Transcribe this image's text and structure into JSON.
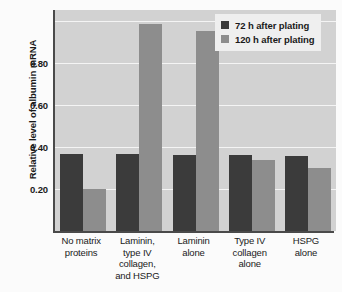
{
  "chart_data": {
    "type": "bar",
    "title": "",
    "xlabel": "",
    "ylabel": "Relative level of albumin mRNA",
    "ylim": [
      0,
      1.05
    ],
    "yticks": [
      0.2,
      0.4,
      0.6,
      0.8
    ],
    "ytick_labels": [
      "0.20",
      "0.40",
      "0.60",
      "0.80"
    ],
    "gridlines": [
      0.2,
      0.4,
      0.6,
      0.8,
      1.0
    ],
    "grid": true,
    "legend_position": "top-right",
    "categories": [
      "No matrix proteins",
      "Laminin, type IV collagen, and HSPG",
      "Laminin alone",
      "Type IV collagen alone",
      "HSPG alone"
    ],
    "category_lines": [
      [
        "No matrix",
        "proteins"
      ],
      [
        "Laminin,",
        "type IV",
        "collagen,",
        "and HSPG"
      ],
      [
        "Laminin",
        "alone"
      ],
      [
        "Type IV",
        "collagen",
        "alone"
      ],
      [
        "HSPG",
        "alone"
      ]
    ],
    "series": [
      {
        "name": "72 h after plating",
        "color": "#3b3b3b",
        "values": [
          0.365,
          0.365,
          0.363,
          0.36,
          0.358
        ]
      },
      {
        "name": "120 h after plating",
        "color": "#8d8d8d",
        "values": [
          0.2,
          0.985,
          0.95,
          0.338,
          0.3
        ]
      }
    ]
  },
  "legend": {
    "entries": [
      {
        "label": "72 h after plating",
        "swatch_color": "#3b3b3b"
      },
      {
        "label": "120 h after plating",
        "swatch_color": "#8d8d8d"
      }
    ]
  },
  "colors": {
    "plot_background": "#d2d2d2",
    "figure_background": "#fbfbfb",
    "gridline": "#f4f4f4",
    "axis": "#4a4a4a",
    "series_72h": "#3b3b3b",
    "series_120h": "#8d8d8d",
    "text": "#1a1a1a"
  }
}
